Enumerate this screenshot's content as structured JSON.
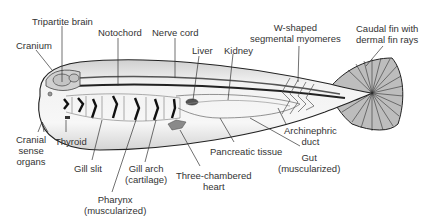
{
  "diagram": {
    "labels": {
      "tripartite_brain": "Tripartite brain",
      "cranium": "Cranium",
      "notochord": "Notochord",
      "nerve_cord": "Nerve cord",
      "liver": "Liver",
      "kidney": "Kidney",
      "myomeres_1": "W-shaped",
      "myomeres_2": "segmental myomeres",
      "caudal_1": "Caudal fin with",
      "caudal_2": "dermal fin rays",
      "cranial_1": "Cranial",
      "cranial_2": "sense",
      "cranial_3": "organs",
      "thyroid": "Thyroid",
      "gill_slit": "Gill slit",
      "gill_arch_1": "Gill arch",
      "gill_arch_2": "(cartilage)",
      "pharynx_1": "Pharynx",
      "pharynx_2": "(muscularized)",
      "heart_1": "Three-chambered",
      "heart_2": "heart",
      "pancreatic": "Pancreatic tissue",
      "archinephric_1": "Archinephric",
      "archinephric_2": "duct",
      "gut_1": "Gut",
      "gut_2": "(muscularized)"
    }
  }
}
